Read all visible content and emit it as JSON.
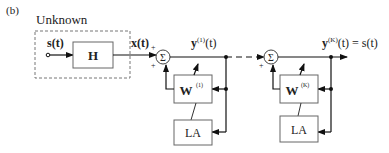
{
  "panel_label": "(b)",
  "unknown_group": {
    "title": "Unknown"
  },
  "signals": {
    "source": "s(t)",
    "mixed": "x(t)",
    "stage1_output": "y",
    "stage1_sup": "(1)",
    "stage1_suffix": "(t)",
    "final_output": "y",
    "final_sup": "(K)",
    "final_suffix": "(t) = s(t)"
  },
  "blocks": {
    "mixing": "H",
    "unmix1": "W",
    "unmix1_sup": "(1)",
    "la1": "LA",
    "unmixK": "W",
    "unmixK_sup": "(K)",
    "laK": "LA"
  },
  "summers": {
    "symbol": "Σ",
    "plus": "+"
  }
}
